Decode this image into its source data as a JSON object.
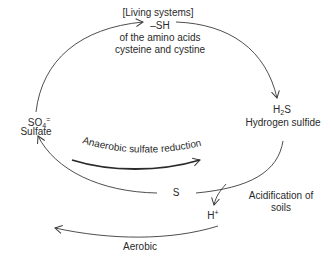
{
  "diagram": {
    "nodes": {
      "living": {
        "header": "[Living systems]",
        "formula": "–SH",
        "line1": "of the amino acids",
        "line2": "cysteine and cystine"
      },
      "sulfate": {
        "formula_main": "SO",
        "formula_sub": "4",
        "formula_sup": "=",
        "name": "Sulfate"
      },
      "h2s": {
        "formula_h": "H",
        "formula_sub": "2",
        "formula_s": "S",
        "name": "Hydrogen sulfide"
      },
      "sulfur": {
        "formula": "S"
      },
      "proton": {
        "formula_main": "H",
        "formula_sup": "+"
      }
    },
    "processes": {
      "anaerobic": "Anaerobic sulfate reduction",
      "aerobic": "Aerobic",
      "acidification_line1": "Acidification of",
      "acidification_line2": "soils"
    },
    "colors": {
      "line": "#3a3a3a",
      "text": "#2a2a2a",
      "background": "#ffffff"
    }
  }
}
